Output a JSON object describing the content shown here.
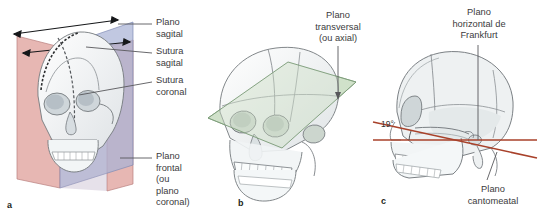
{
  "figure": {
    "background": "#ffffff"
  },
  "panels": [
    {
      "letter": "a",
      "name": "panel-a-sagittal-frontal-planes",
      "labels": [
        {
          "id": "plano-sagital",
          "text": "Plano\nsagital"
        },
        {
          "id": "sutura-sagital",
          "text": "Sutura\nsagital"
        },
        {
          "id": "sutura-coronal",
          "text": "Sutura\ncoronal"
        },
        {
          "id": "plano-frontal",
          "text": "Plano frontal\n(ou plano\ncoronal)"
        }
      ],
      "planes": [
        {
          "id": "sagittal-plane",
          "color": "#8c9cc4",
          "fill": "#aab4d4"
        },
        {
          "id": "frontal-plane",
          "color": "#c98f90",
          "fill": "#e0a9a6"
        }
      ]
    },
    {
      "letter": "b",
      "name": "panel-b-transverse-plane",
      "labels": [
        {
          "id": "plano-transversal",
          "text": "Plano\ntransversal\n(ou axial)"
        }
      ],
      "planes": [
        {
          "id": "transverse-plane",
          "color": "#7fa07c",
          "fill": "#cfe0c8"
        }
      ]
    },
    {
      "letter": "c",
      "name": "panel-c-frankfurt-cantomeatal",
      "labels": [
        {
          "id": "plano-horizontal-frankfurt",
          "text": "Plano\nhorizontal de\nFrankfurt"
        },
        {
          "id": "plano-cantomeatal",
          "text": "Plano\ncantomeatal"
        },
        {
          "id": "angulo",
          "text": "19°"
        }
      ],
      "lines": [
        {
          "id": "frankfurt-line",
          "color": "#a8412a"
        },
        {
          "id": "cantomeatal-line",
          "color": "#a8412a"
        }
      ]
    }
  ],
  "colors": {
    "skull_outline": "#6b6f73",
    "skull_fill": "#edf0ef",
    "sagittal_plane": "#aab4d4",
    "frontal_plane": "#e0a9a6",
    "transverse_plane": "#cfe0c8",
    "reference_line": "#a8412a",
    "leader_line": "#58585b",
    "text": "#3b3b3d"
  }
}
